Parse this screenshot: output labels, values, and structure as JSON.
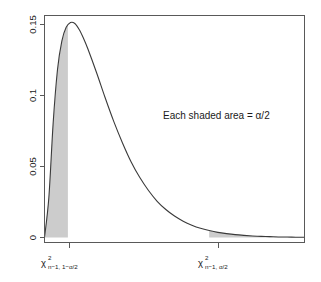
{
  "chart_data": {
    "type": "line",
    "title": "",
    "subtitle": "",
    "xlabel": "",
    "ylabel": "",
    "grid": false,
    "legend": null,
    "xlim": [
      0,
      30
    ],
    "ylim": [
      0,
      0.16
    ],
    "x_tick_labels": [
      "chi^2_{n-1, 1-alpha/2}",
      "chi^2_{n-1, alpha/2}"
    ],
    "x_tick_values": [
      2.7,
      19.0
    ],
    "y_tick_labels": [
      "0",
      "0.05",
      "0.1",
      "0.15"
    ],
    "y_tick_values": [
      0,
      0.05,
      0.1,
      0.15
    ],
    "curve_name": "chi-square density, df = n-1",
    "degrees_of_freedom": 5,
    "peak": {
      "x": 3.0,
      "y": 0.153
    },
    "x": [
      0.0,
      0.5,
      1.0,
      1.5,
      2.0,
      2.5,
      3.0,
      3.5,
      4.0,
      4.5,
      5.0,
      6.0,
      7.0,
      8.0,
      9.0,
      10.0,
      11.0,
      12.0,
      13.0,
      14.0,
      15.0,
      16.0,
      17.0,
      18.0,
      19.0,
      20.0,
      21.0,
      22.0,
      23.0,
      24.0,
      25.0,
      26.0,
      27.0,
      28.0,
      29.0,
      30.0
    ],
    "y": [
      0.0,
      0.028,
      0.0807,
      0.1183,
      0.1383,
      0.148,
      0.1514,
      0.1507,
      0.1465,
      0.1403,
      0.1329,
      0.1162,
      0.0984,
      0.0816,
      0.0666,
      0.0532,
      0.0422,
      0.0331,
      0.0255,
      0.0197,
      0.0151,
      0.0115,
      0.0087,
      0.0065,
      0.0049,
      0.0036,
      0.0027,
      0.002,
      0.0015,
      0.0011,
      0.0008,
      0.0006,
      0.0004,
      0.0003,
      0.0002,
      0.0002
    ],
    "shaded_regions": [
      {
        "name": "left-tail",
        "from": 0.0,
        "to": 2.7,
        "label": "alpha/2",
        "fill": "#cccccc"
      },
      {
        "name": "right-tail",
        "from": 19.0,
        "to": 30.0,
        "label": "alpha/2",
        "fill": "#cccccc"
      }
    ],
    "annotations": [
      {
        "name": "shaded-area-note",
        "text": "Each shaded area = α/2",
        "x": 14.0,
        "y": 0.092
      }
    ]
  },
  "plot": {
    "annotation_note": "Each shaded area = α/2",
    "y_ticks": [
      {
        "label": "0.15"
      },
      {
        "label": "0.1"
      },
      {
        "label": "0.05"
      },
      {
        "label": "0"
      }
    ],
    "x_ticks": [
      {
        "base": "χ",
        "superscript": "2",
        "subscript": "n−1, 1−α/2"
      },
      {
        "base": "χ",
        "superscript": "2",
        "subscript": "n−1, α/2"
      }
    ],
    "colors": {
      "axis": "#4d4d4d",
      "curve": "#3a3a3a",
      "shade": "#cccccc",
      "background": "#ffffff",
      "text": "#1a1a1a"
    }
  }
}
